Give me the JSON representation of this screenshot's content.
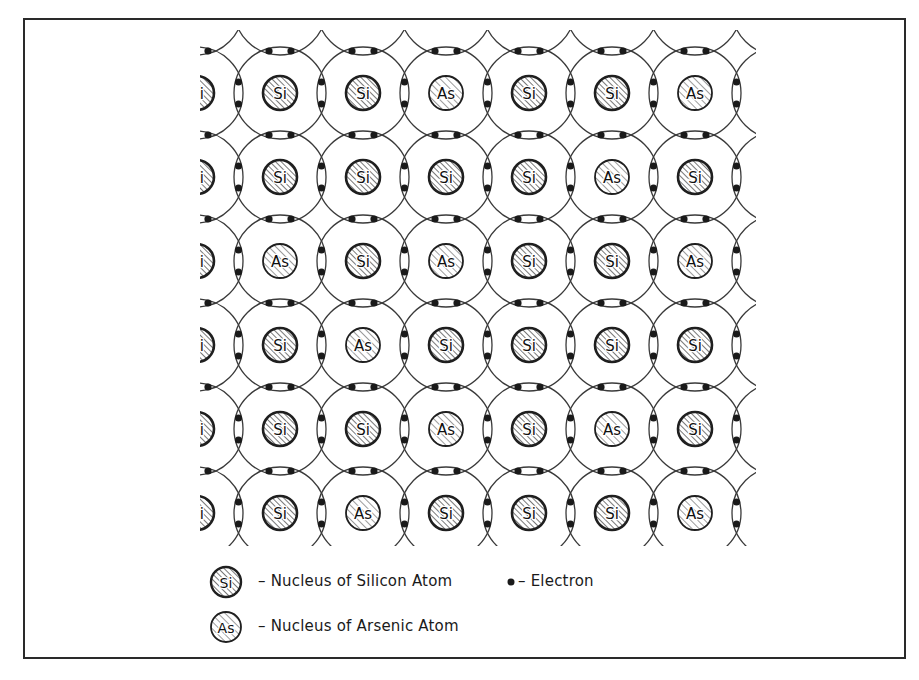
{
  "diagram": {
    "title": "",
    "lattice": {
      "rows": [
        [
          "Si",
          "Si",
          "As",
          "Si",
          "Si",
          "As"
        ],
        [
          "Si",
          "Si",
          "Si",
          "Si",
          "As",
          "Si"
        ],
        [
          "As",
          "Si",
          "As",
          "Si",
          "Si",
          "As"
        ],
        [
          "Si",
          "As",
          "Si",
          "Si",
          "Si",
          "Si"
        ],
        [
          "Si",
          "Si",
          "As",
          "Si",
          "As",
          "Si"
        ],
        [
          "Si",
          "As",
          "Si",
          "Si",
          "Si",
          "As"
        ]
      ],
      "origin_x": 280,
      "origin_y": 93,
      "spacing_x": 83,
      "spacing_y": 84,
      "orbit_radius": 46,
      "nucleus_radius": 17,
      "clip": {
        "x": 200,
        "y": 30,
        "width": 556,
        "height": 516
      }
    },
    "legend": {
      "silicon": {
        "symbol": "Si",
        "label": "– Nucleus of Silicon Atom"
      },
      "arsenic": {
        "symbol": "As",
        "label": "– Nucleus of Arsenic Atom"
      },
      "electron": {
        "label": "– Electron"
      }
    },
    "colors": {
      "line": "#3a3a3a",
      "nucleus_border": "#1f1f1f",
      "hatch": "#5a5a5a",
      "electron": "#1a1a1a"
    }
  }
}
